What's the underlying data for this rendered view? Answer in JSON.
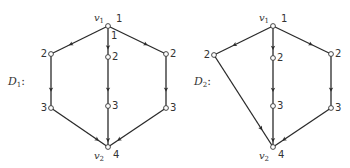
{
  "diagrams": [
    {
      "name": "D",
      "sub": "1",
      "label_suffix": ":",
      "label_pos": [
        8,
        85
      ],
      "nodes": [
        {
          "id": "v1",
          "x": 108,
          "y": 26,
          "num": "1",
          "var": "v",
          "var_sub": "1"
        },
        {
          "id": "L2",
          "x": 51,
          "y": 54,
          "num": "2"
        },
        {
          "id": "L3",
          "x": 51,
          "y": 108,
          "num": "3"
        },
        {
          "id": "C2",
          "x": 108,
          "y": 57,
          "num": "2"
        },
        {
          "id": "C3",
          "x": 108,
          "y": 106,
          "num": "3"
        },
        {
          "id": "R2",
          "x": 166,
          "y": 54,
          "num": "2"
        },
        {
          "id": "R3",
          "x": 166,
          "y": 108,
          "num": "3"
        },
        {
          "id": "v2",
          "x": 108,
          "y": 147,
          "num": "4",
          "var": "v",
          "var_sub": "2"
        }
      ],
      "edges": [
        [
          "v1",
          "L2"
        ],
        [
          "L2",
          "L3"
        ],
        [
          "L3",
          "v2"
        ],
        [
          "v1",
          "C2"
        ],
        [
          "C2",
          "C3"
        ],
        [
          "C3",
          "v2"
        ],
        [
          "v1",
          "R2"
        ],
        [
          "R2",
          "R3"
        ],
        [
          "R3",
          "v2"
        ]
      ],
      "extra_labels": [
        {
          "text": "1",
          "x": 111,
          "y": 39
        }
      ]
    },
    {
      "name": "D",
      "sub": "2",
      "label_suffix": ":",
      "label_pos": [
        194,
        85
      ],
      "nodes": [
        {
          "id": "v1",
          "x": 273,
          "y": 26,
          "num": "1",
          "var": "v",
          "var_sub": "1"
        },
        {
          "id": "L2",
          "x": 214,
          "y": 55,
          "num": "2"
        },
        {
          "id": "C2",
          "x": 273,
          "y": 58,
          "num": "2"
        },
        {
          "id": "C3",
          "x": 273,
          "y": 106,
          "num": "3"
        },
        {
          "id": "R2",
          "x": 331,
          "y": 54,
          "num": "2"
        },
        {
          "id": "R3",
          "x": 331,
          "y": 108,
          "num": "3"
        },
        {
          "id": "v2",
          "x": 273,
          "y": 147,
          "num": "4",
          "var": "v",
          "var_sub": "2"
        }
      ],
      "edges": [
        [
          "v1",
          "L2"
        ],
        [
          "L2",
          "v2"
        ],
        [
          "v1",
          "C2"
        ],
        [
          "C2",
          "C3"
        ],
        [
          "C3",
          "v2"
        ],
        [
          "v1",
          "R2"
        ],
        [
          "R2",
          "R3"
        ],
        [
          "R3",
          "v2"
        ]
      ],
      "extra_labels": []
    }
  ]
}
